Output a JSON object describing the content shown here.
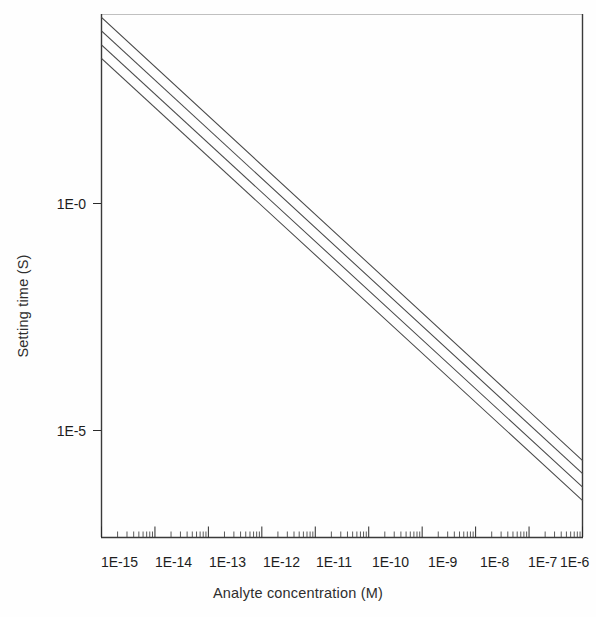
{
  "chart_data": {
    "type": "line",
    "title": "",
    "subtitle": "",
    "xlabel": "Analyte concentration (M)",
    "ylabel": "Setting time (S)",
    "xscale": "log",
    "yscale": "log",
    "grid": false,
    "legend": "none",
    "xlim": [
      1e-15,
      1e-06
    ],
    "ylim": [
      4e-08,
      6000.0
    ],
    "xtick_labels": [
      "1E-15",
      "1E-14",
      "1E-13",
      "1E-12",
      "1E-11",
      "1E-10",
      "1E-9",
      "1E-8",
      "1E-7",
      "1E-6"
    ],
    "xtick_values": [
      1e-15,
      1e-14,
      1e-13,
      1e-12,
      1e-11,
      1e-10,
      1e-09,
      1e-08,
      1e-07,
      1e-06
    ],
    "ytick_labels": [
      "1E-0",
      "1E-5"
    ],
    "ytick_values": [
      1,
      1e-05
    ],
    "minor_ticks_x": true,
    "minor_ticks_y": false,
    "series": [
      {
        "name": "curve-1",
        "x": [
          1e-15,
          1e-06
        ],
        "y": [
          2500.0,
          7.24e-05
        ]
      },
      {
        "name": "curve-2",
        "x": [
          1e-15,
          1e-06
        ],
        "y": [
          1100.0,
          3.63e-05
        ]
      },
      {
        "name": "curve-3",
        "x": [
          1e-15,
          1e-06
        ],
        "y": [
          460.0,
          1.55e-05
        ]
      },
      {
        "name": "curve-4",
        "x": [
          1e-15,
          1e-06
        ],
        "y": [
          200.0,
          6.9e-06
        ]
      }
    ]
  },
  "axes": {
    "x_title": "Analyte concentration (M)",
    "y_title": "Setting time (S)",
    "x_labels": [
      "1E-15",
      "1E-14",
      "1E-13",
      "1E-12",
      "1E-11",
      "1E-10",
      "1E-9",
      "1E-8",
      "1E-7",
      "1E-6"
    ],
    "y_labels": [
      "1E-0",
      "1E-5"
    ]
  },
  "style": {
    "line_color": "#4a4a4a",
    "axis_color": "#3a3a3a",
    "text_color": "#1d1d1d",
    "background": "#fefefe"
  }
}
